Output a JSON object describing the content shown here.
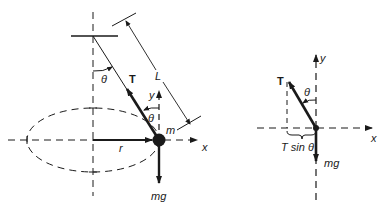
{
  "figure": {
    "left_panel": {
      "description": "Conical pendulum: mass m on string of length L moving in horizontal circle of radius r",
      "labels": {
        "tension": "T",
        "length": "L",
        "angle_top": "θ",
        "angle_mass": "θ",
        "mass": "m",
        "radius": "r",
        "weight": "mg",
        "x_axis": "x",
        "y_axis": "y"
      }
    },
    "right_panel": {
      "description": "Free-body diagram of the mass",
      "labels": {
        "tension": "T",
        "angle": "θ",
        "horizontal_component": "T sin θ",
        "weight": "mg",
        "x_axis": "x",
        "y_axis": "y"
      }
    },
    "colors": {
      "ink": "#1a1a1a",
      "background": "#ffffff"
    }
  }
}
